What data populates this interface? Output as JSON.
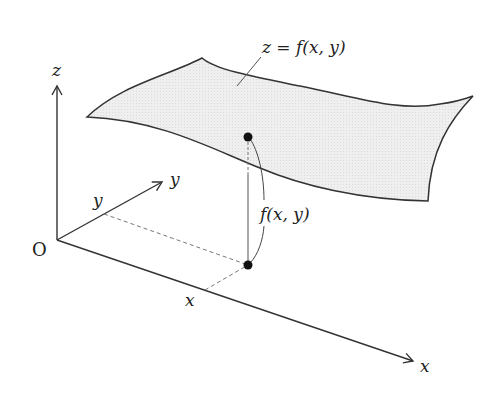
{
  "diagram": {
    "type": "3d-surface-function-graph",
    "surface_label": "z = f(x, y)",
    "height_label": "f(x, y)",
    "axes": {
      "x": {
        "label": "x"
      },
      "y": {
        "label": "y"
      },
      "z": {
        "label": "z"
      }
    },
    "origin_label": "O",
    "point_coordinate_labels": {
      "x": "x",
      "y": "y"
    },
    "colors": {
      "line": "#333333",
      "surface_fill": "#ececec",
      "point": "#111111",
      "dashed": "#777777"
    }
  }
}
